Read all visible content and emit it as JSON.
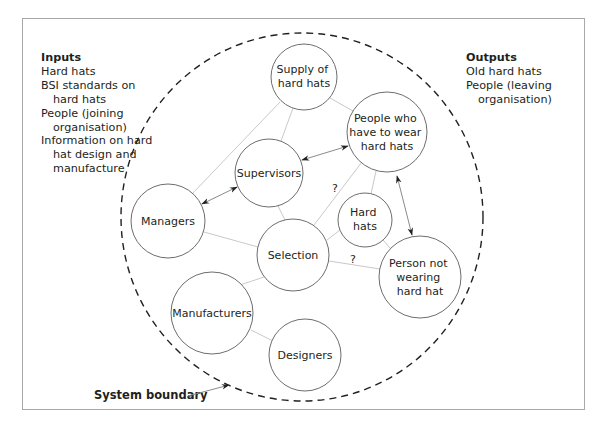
{
  "inputs": {
    "title": "Inputs",
    "items": [
      "Hard hats",
      "BSI standards on hard hats",
      "People (joining organisation)",
      "Information on hard hat design and manufacture"
    ]
  },
  "outputs": {
    "title": "Outputs",
    "items": [
      "Old hard hats",
      "People (leaving organisation)"
    ]
  },
  "boundary": {
    "label": "System boundary"
  },
  "nodes": {
    "supply": [
      "Supply of",
      "hard hats"
    ],
    "people_wear": [
      "People who",
      "have to wear",
      "hard hats"
    ],
    "supervisors": [
      "Supervisors"
    ],
    "managers": [
      "Managers"
    ],
    "hard_hats": [
      "Hard",
      "hats"
    ],
    "selection": [
      "Selection"
    ],
    "person_not": [
      "Person not",
      "wearing",
      "hard hat"
    ],
    "manufacturers": [
      "Manufacturers"
    ],
    "designers": [
      "Designers"
    ]
  },
  "annotations": {
    "q1": "?",
    "q2": "?"
  },
  "colors": {
    "circle_stroke": "#6d6d6d",
    "link_stroke": "#c9c9c9",
    "boundary_stroke": "#231f20",
    "frame_stroke": "#a8a8a8"
  }
}
